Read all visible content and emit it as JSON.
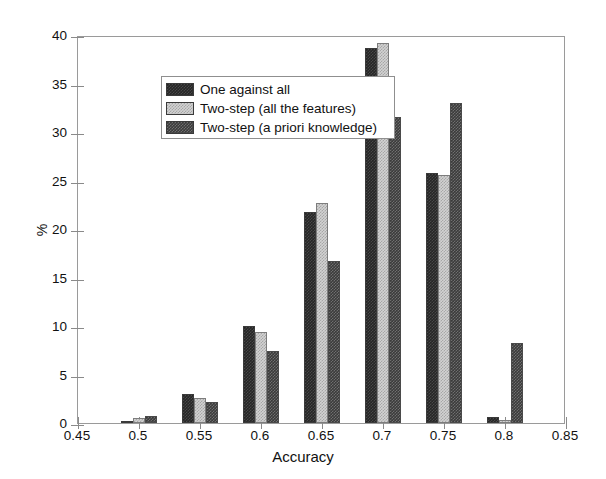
{
  "chart_data": {
    "type": "bar",
    "title": "",
    "xlabel": "Accuracy",
    "ylabel": "%",
    "xlim": [
      0.45,
      0.85
    ],
    "ylim": [
      0,
      40
    ],
    "xticks": [
      "0.45",
      "0.5",
      "0.55",
      "0.6",
      "0.65",
      "0.7",
      "0.75",
      "0.8",
      "0.85"
    ],
    "yticks": [
      "0",
      "5",
      "10",
      "15",
      "20",
      "25",
      "30",
      "35",
      "40"
    ],
    "grid": false,
    "legend_position": "top-left",
    "categories": [
      "0.5",
      "0.55",
      "0.6",
      "0.65",
      "0.7",
      "0.75",
      "0.8"
    ],
    "series": [
      {
        "name": "One against all",
        "fill": "dark-checker",
        "color": "#262626",
        "values": [
          0.2,
          3.0,
          10.0,
          21.8,
          38.7,
          25.8,
          0.6
        ]
      },
      {
        "name": "Two-step (all the features)",
        "fill": "light-dotted",
        "color": "#d2d2d2",
        "values": [
          0.5,
          2.6,
          9.4,
          22.7,
          39.2,
          25.6,
          0.3
        ]
      },
      {
        "name": "Two-step (a priori knowledge)",
        "fill": "mid-dark-checker",
        "color": "#3b3b3b",
        "values": [
          0.7,
          2.2,
          7.4,
          16.7,
          31.5,
          33.0,
          8.3
        ]
      }
    ]
  },
  "axes": {
    "y_title": "%",
    "x_title": "Accuracy"
  },
  "legend": {
    "items": [
      {
        "label": "One against all"
      },
      {
        "label": "Two-step (all the features)"
      },
      {
        "label": "Two-step (a priori knowledge)"
      }
    ]
  }
}
